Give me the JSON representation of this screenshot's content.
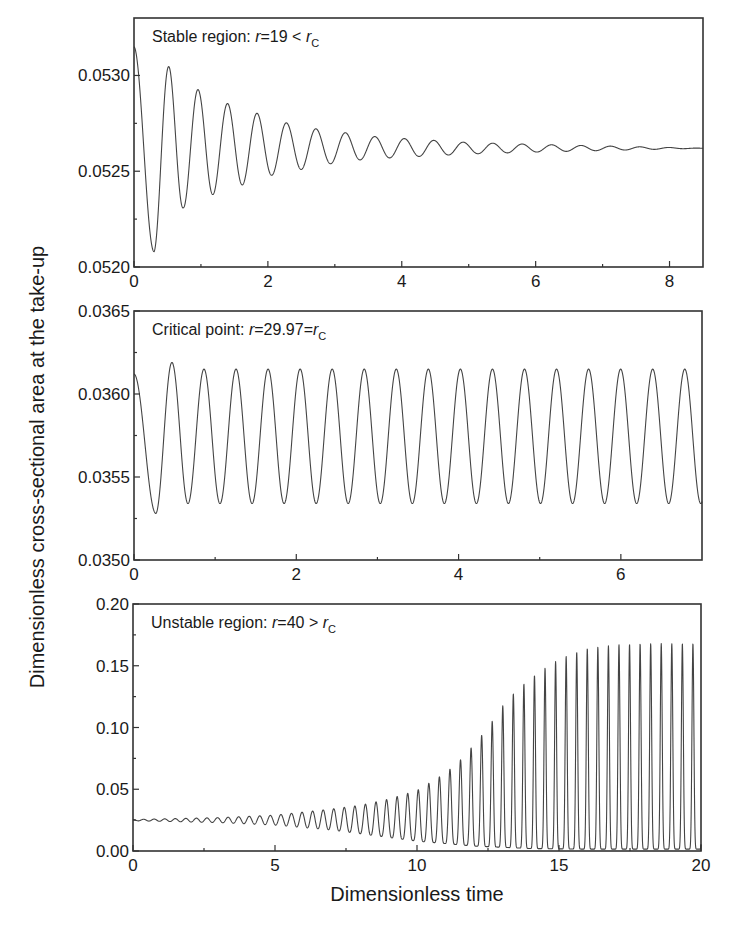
{
  "figure": {
    "ylabel": "Dimensionless cross-sectional area at the take-up",
    "xlabel": "Dimensionless time"
  },
  "chart_data": [
    {
      "type": "line",
      "title": "",
      "annotation": {
        "prefix": "Stable region: ",
        "var": "r",
        "rel": "=19 < ",
        "rhs_var": "r",
        "rhs_sub": "C"
      },
      "xlabel": "Dimensionless time",
      "ylabel": "Dimensionless cross-sectional area at the take-up",
      "xlim": [
        0,
        8.5
      ],
      "ylim": [
        0.052,
        0.0533
      ],
      "xticks": [
        0,
        2,
        4,
        6,
        8
      ],
      "xtick_labels": [
        "0",
        "2",
        "4",
        "6",
        "8"
      ],
      "xminor": [
        1,
        3,
        5,
        7
      ],
      "yticks": [
        0.052,
        0.0525,
        0.053
      ],
      "ytick_labels": [
        "0.0520",
        "0.0525",
        "0.0530"
      ],
      "yminor": [
        0.05225,
        0.05275
      ],
      "grid": false,
      "series": [
        {
          "name": "stable (r=19)",
          "model": "damped_oscillation",
          "start_value": 0.05315,
          "equilibrium": 0.05262,
          "first_min": 0.05208,
          "first_min_t": 0.3,
          "period": 0.44,
          "peaks": [
            [
              0.0,
              0.05315
            ],
            [
              0.55,
              0.05304
            ],
            [
              0.98,
              0.05292
            ],
            [
              1.42,
              0.05285
            ],
            [
              1.86,
              0.0528
            ],
            [
              2.3,
              0.05275
            ],
            [
              2.74,
              0.05272
            ],
            [
              3.18,
              0.0527
            ],
            [
              3.62,
              0.05268
            ],
            [
              4.06,
              0.05267
            ],
            [
              5.0,
              0.05265
            ],
            [
              6.0,
              0.05264
            ],
            [
              8.5,
              0.05262
            ]
          ],
          "troughs": [
            [
              0.3,
              0.05208
            ],
            [
              0.74,
              0.05231
            ],
            [
              1.19,
              0.05238
            ],
            [
              1.63,
              0.05243
            ],
            [
              2.07,
              0.05248
            ],
            [
              2.51,
              0.05251
            ],
            [
              2.95,
              0.05254
            ],
            [
              3.4,
              0.05256
            ],
            [
              3.84,
              0.05257
            ],
            [
              5.0,
              0.05259
            ],
            [
              6.0,
              0.0526
            ],
            [
              8.5,
              0.05262
            ]
          ]
        }
      ]
    },
    {
      "type": "line",
      "title": "",
      "annotation": {
        "prefix": "Critical point: ",
        "var": "r",
        "rel": "=29.97=",
        "rhs_var": "r",
        "rhs_sub": "C"
      },
      "xlabel": "Dimensionless time",
      "ylabel": "Dimensionless cross-sectional area at the take-up",
      "xlim": [
        0,
        7
      ],
      "ylim": [
        0.035,
        0.0365
      ],
      "xticks": [
        0,
        2,
        4,
        6
      ],
      "xtick_labels": [
        "0",
        "2",
        "4",
        "6"
      ],
      "xminor": [
        1,
        3,
        5
      ],
      "yticks": [
        0.035,
        0.0355,
        0.036,
        0.0365
      ],
      "ytick_labels": [
        "0.0350",
        "0.0355",
        "0.0360",
        "0.0365"
      ],
      "yminor": [
        0.03525,
        0.03575,
        0.03625
      ],
      "grid": false,
      "series": [
        {
          "name": "critical (r=29.97)",
          "model": "sustained_oscillation",
          "start_value": 0.03612,
          "first_min": 0.03528,
          "first_min_t": 0.27,
          "first_peak": 0.03619,
          "period": 0.395,
          "max": 0.03615,
          "min": 0.03534,
          "end_value": 0.03533
        }
      ]
    },
    {
      "type": "line",
      "title": "",
      "annotation": {
        "prefix": "Unstable region: ",
        "var": "r",
        "rel": "=40 > ",
        "rhs_var": "r",
        "rhs_sub": "C"
      },
      "xlabel": "Dimensionless time",
      "ylabel": "Dimensionless cross-sectional area at the take-up",
      "xlim": [
        0,
        20
      ],
      "ylim": [
        0.0,
        0.2
      ],
      "xticks": [
        0,
        5,
        10,
        15,
        20
      ],
      "xtick_labels": [
        "0",
        "5",
        "10",
        "15",
        "20"
      ],
      "xminor": [
        2.5,
        7.5,
        12.5,
        17.5
      ],
      "yticks": [
        0.0,
        0.05,
        0.1,
        0.15,
        0.2
      ],
      "ytick_labels": [
        "0.00",
        "0.05",
        "0.10",
        "0.15",
        "0.20"
      ],
      "yminor": [
        0.025,
        0.075,
        0.125,
        0.175
      ],
      "grid": false,
      "series": [
        {
          "name": "unstable (r=40)",
          "model": "growing_oscillation",
          "base_value": 0.025,
          "period": 0.372,
          "envelope_peaks": [
            [
              0,
              0.0255
            ],
            [
              3,
              0.027
            ],
            [
              5,
              0.029
            ],
            [
              7,
              0.034
            ],
            [
              8,
              0.037
            ],
            [
              9,
              0.042
            ],
            [
              10,
              0.049
            ],
            [
              10.5,
              0.056
            ],
            [
              11,
              0.063
            ],
            [
              11.5,
              0.073
            ],
            [
              12,
              0.086
            ],
            [
              12.5,
              0.1
            ],
            [
              13,
              0.117
            ],
            [
              13.5,
              0.13
            ],
            [
              14,
              0.14
            ],
            [
              14.5,
              0.148
            ],
            [
              15,
              0.155
            ],
            [
              15.5,
              0.16
            ],
            [
              16,
              0.164
            ],
            [
              17,
              0.167
            ],
            [
              18,
              0.168
            ],
            [
              20,
              0.168
            ]
          ],
          "envelope_troughs": [
            [
              0,
              0.0245
            ],
            [
              3,
              0.023
            ],
            [
              5,
              0.021
            ],
            [
              7,
              0.017
            ],
            [
              8,
              0.014
            ],
            [
              9,
              0.011
            ],
            [
              10,
              0.008
            ],
            [
              11,
              0.006
            ],
            [
              12,
              0.004
            ],
            [
              13,
              0.003
            ],
            [
              14,
              0.002
            ],
            [
              16,
              0.0015
            ],
            [
              20,
              0.0015
            ]
          ]
        }
      ]
    }
  ],
  "layout": {
    "panels": [
      {
        "left": 134,
        "top": 18,
        "right": 703,
        "bottom": 267
      },
      {
        "left": 134,
        "top": 311,
        "right": 702,
        "bottom": 560
      },
      {
        "left": 133,
        "top": 604,
        "right": 701,
        "bottom": 851
      }
    ]
  }
}
